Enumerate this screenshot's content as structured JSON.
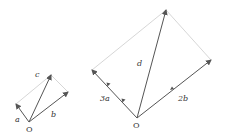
{
  "diagram": {
    "left": {
      "origin_label": "O",
      "vectors": [
        {
          "name": "a",
          "label": "a"
        },
        {
          "name": "b",
          "label": "b"
        },
        {
          "name": "c",
          "label": "c"
        }
      ]
    },
    "right": {
      "origin_label": "O",
      "vectors": [
        {
          "name": "3a",
          "label": "3a"
        },
        {
          "name": "2b",
          "label": "2b"
        },
        {
          "name": "d",
          "label": "d"
        }
      ]
    },
    "colors": {
      "vector": "#555555",
      "guide": "#cccccc",
      "text": "#333333"
    }
  }
}
